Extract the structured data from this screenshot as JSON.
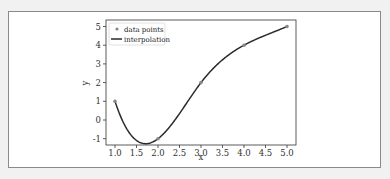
{
  "chart_data": {
    "type": "line",
    "title": "",
    "xlabel": "x",
    "ylabel": "y",
    "xlim": [
      0.9,
      5.1
    ],
    "ylim": [
      -1.3,
      5.4
    ],
    "xticks": [
      "1.0",
      "1.5",
      "2.0",
      "2.5",
      "3.0",
      "3.5",
      "4.0",
      "4.5",
      "5.0"
    ],
    "yticks": [
      "-1",
      "0",
      "1",
      "2",
      "3",
      "4",
      "5"
    ],
    "grid": false,
    "legend_position": "upper left",
    "series": [
      {
        "name": "data points",
        "kind": "scatter",
        "color": "#888888",
        "x": [
          1,
          2,
          3,
          4,
          5
        ],
        "y": [
          1,
          -1,
          2,
          4,
          5
        ]
      },
      {
        "name": "interpolation",
        "kind": "line",
        "method": "cubic spline",
        "color": "#2b2b2b",
        "x": [
          1,
          2,
          3,
          4,
          5
        ],
        "y": [
          1,
          -1,
          2,
          4,
          5
        ]
      }
    ]
  },
  "legend": {
    "items": [
      "data points",
      "interpolation"
    ]
  }
}
